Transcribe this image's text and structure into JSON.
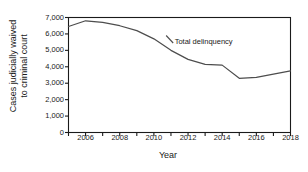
{
  "chart_data": {
    "type": "line",
    "title": "",
    "xlabel": "Year",
    "ylabel_line1": "Cases judicially waived",
    "ylabel_line2": "to criminal court",
    "ylim": [
      0,
      7000
    ],
    "xlim": [
      2005,
      2018
    ],
    "yticks": [
      0,
      1000,
      2000,
      3000,
      4000,
      5000,
      6000,
      7000
    ],
    "ytick_labels": [
      "0",
      "1,000",
      "2,000",
      "3,000",
      "4,000",
      "5,000",
      "6,000",
      "7,000"
    ],
    "xticks": [
      2005,
      2006,
      2007,
      2008,
      2009,
      2010,
      2011,
      2012,
      2013,
      2014,
      2015,
      2016,
      2017,
      2018
    ],
    "xtick_labels": [
      "",
      "2006",
      "",
      "2008",
      "",
      "2010",
      "",
      "2012",
      "",
      "2014",
      "",
      "2016",
      "",
      "2018"
    ],
    "grid": false,
    "legend_position": "inline-annotation",
    "annotations": [
      {
        "text": "Total delinquency",
        "x": 2011.1,
        "y": 5600
      }
    ],
    "series": [
      {
        "name": "Total delinquency",
        "color": "#4d4d4d",
        "x": [
          2005,
          2006,
          2007,
          2008,
          2009,
          2010,
          2011,
          2012,
          2013,
          2014,
          2015,
          2016,
          2017,
          2018
        ],
        "values": [
          6450,
          6800,
          6700,
          6500,
          6200,
          5700,
          5000,
          4450,
          4150,
          4100,
          3300,
          3350,
          3550,
          3750
        ]
      }
    ]
  }
}
